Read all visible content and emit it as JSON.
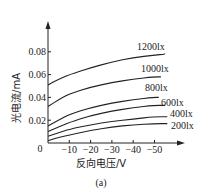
{
  "chart_data": {
    "type": "line",
    "title": "",
    "caption": "(a)",
    "xlabel": "反向电压/V",
    "ylabel": "光电流/mA",
    "origin_label": "0",
    "x_ticks": [
      -10,
      -20,
      -30,
      -40,
      -50
    ],
    "x_tick_labels": [
      "−10",
      "−20",
      "−30",
      "−40",
      "−50"
    ],
    "y_ticks": [
      0.02,
      0.04,
      0.06,
      0.08
    ],
    "y_tick_labels": [
      "0.02",
      "0.04",
      "0.06",
      "0.08"
    ],
    "xlim": [
      0,
      -60
    ],
    "ylim": [
      0,
      0.1
    ],
    "grid": false,
    "legend_position": "inline-right",
    "x": [
      0,
      -5,
      -10,
      -20,
      -30,
      -40,
      -50,
      -55
    ],
    "series": [
      {
        "name": "1200lx",
        "values": [
          0.051,
          0.056,
          0.06,
          0.066,
          0.071,
          0.075,
          0.077,
          0.078
        ]
      },
      {
        "name": "1000lx",
        "values": [
          0.032,
          0.038,
          0.043,
          0.049,
          0.053,
          0.056,
          0.058,
          0.058
        ]
      },
      {
        "name": "800lx",
        "values": [
          0.015,
          0.02,
          0.025,
          0.031,
          0.035,
          0.038,
          0.04,
          0.04
        ]
      },
      {
        "name": "600lx",
        "values": [
          0.01,
          0.014,
          0.018,
          0.024,
          0.028,
          0.031,
          0.033,
          0.033
        ]
      },
      {
        "name": "400lx",
        "values": [
          0.006,
          0.009,
          0.012,
          0.016,
          0.019,
          0.021,
          0.023,
          0.023
        ]
      },
      {
        "name": "200lx",
        "values": [
          0.002,
          0.005,
          0.007,
          0.011,
          0.014,
          0.016,
          0.017,
          0.017
        ]
      }
    ]
  }
}
